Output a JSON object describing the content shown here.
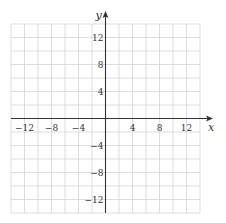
{
  "chart_data": {
    "type": "scatter",
    "title": "",
    "xlabel": "x",
    "ylabel": "y",
    "xlim": [
      -14,
      14
    ],
    "ylim": [
      -14,
      14
    ],
    "grid": true,
    "grid_step": 2,
    "x_ticks": [
      -12,
      -8,
      -4,
      4,
      8,
      12
    ],
    "y_ticks": [
      12,
      8,
      4,
      -4,
      -8,
      -12
    ],
    "x_tick_labels": [
      "−12",
      "−8",
      "−4",
      "4",
      "8",
      "12"
    ],
    "y_tick_labels": [
      "12",
      "8",
      "4",
      "−4",
      "−8",
      "−12"
    ],
    "series": [],
    "legend": null
  },
  "colors": {
    "grid": "#d4d4d4",
    "axis": "#333333",
    "text": "#333333",
    "background": "#ffffff"
  }
}
